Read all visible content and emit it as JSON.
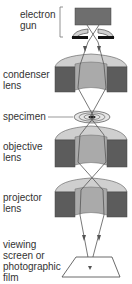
{
  "diagram": {
    "labels": {
      "electron_gun": [
        "electron",
        "gun"
      ],
      "condenser_lens": [
        "condenser",
        "lens"
      ],
      "specimen": "specimen",
      "objective_lens": [
        "objective",
        "lens"
      ],
      "projector_lens": [
        "projector",
        "lens"
      ],
      "viewing_screen": [
        "viewing",
        "screen or",
        "photographic",
        "film"
      ]
    },
    "colors": {
      "gun_block": "#6e6e6e",
      "lens_top": "#c8c8c8",
      "lens_side": "#5a5a5a",
      "lens_inner": "#a8a8a8",
      "beam": "#555555",
      "background": "#ffffff"
    }
  }
}
